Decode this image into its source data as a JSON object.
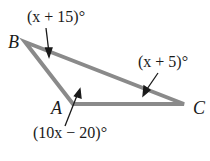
{
  "diagram": {
    "type": "triangle",
    "vertices": [
      {
        "label": "A",
        "x": 73,
        "y": 104
      },
      {
        "label": "B",
        "x": 25,
        "y": 42
      },
      {
        "label": "C",
        "x": 184,
        "y": 104
      }
    ],
    "angles": [
      {
        "vertex": "B",
        "label": "(x + 15)°"
      },
      {
        "vertex": "C",
        "label": "(x + 5)°"
      },
      {
        "vertex": "A",
        "label": "(10x − 20)°"
      }
    ],
    "stroke_color": "#808080"
  }
}
